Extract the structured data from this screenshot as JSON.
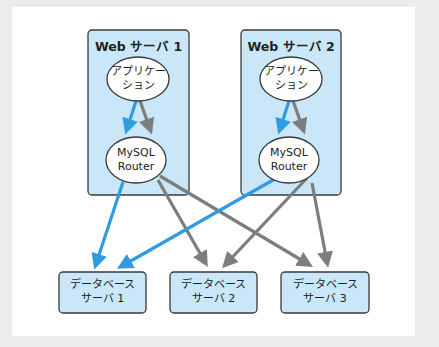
{
  "colors": {
    "background": "#ececec",
    "frame": "#ffffff",
    "box_fill": "#c9e7f8",
    "box_border": "#3a3a3a",
    "ellipse_fill": "#ffffff",
    "primary_arrow": "#2f9be0",
    "secondary_arrow": "#7d7d7d"
  },
  "web_servers": [
    {
      "title": "Web サーバ 1",
      "app": {
        "line1": "アプリケー",
        "line2": "ション"
      },
      "router": {
        "line1": "MySQL",
        "line2": "Router"
      }
    },
    {
      "title": "Web サーバ 2",
      "app": {
        "line1": "アプリケー",
        "line2": "ション"
      },
      "router": {
        "line1": "MySQL",
        "line2": "Router"
      }
    }
  ],
  "db_servers": [
    {
      "line1": "データベース",
      "line2": "サーバ 1"
    },
    {
      "line1": "データベース",
      "line2": "サーバ 2"
    },
    {
      "line1": "データベース",
      "line2": "サーバ 3"
    }
  ],
  "connections": [
    {
      "from": "Web サーバ 1 アプリケーション",
      "to": "Web サーバ 1 MySQL Router",
      "type": "primary"
    },
    {
      "from": "Web サーバ 1 アプリケーション",
      "to": "Web サーバ 1 MySQL Router",
      "type": "secondary"
    },
    {
      "from": "Web サーバ 2 アプリケーション",
      "to": "Web サーバ 2 MySQL Router",
      "type": "primary"
    },
    {
      "from": "Web サーバ 2 アプリケーション",
      "to": "Web サーバ 2 MySQL Router",
      "type": "secondary"
    },
    {
      "from": "Web サーバ 1 MySQL Router",
      "to": "データベース サーバ 1",
      "type": "primary"
    },
    {
      "from": "Web サーバ 1 MySQL Router",
      "to": "データベース サーバ 2",
      "type": "secondary"
    },
    {
      "from": "Web サーバ 1 MySQL Router",
      "to": "データベース サーバ 3",
      "type": "secondary"
    },
    {
      "from": "Web サーバ 2 MySQL Router",
      "to": "データベース サーバ 1",
      "type": "primary"
    },
    {
      "from": "Web サーバ 2 MySQL Router",
      "to": "データベース サーバ 2",
      "type": "secondary"
    },
    {
      "from": "Web サーバ 2 MySQL Router",
      "to": "データベース サーバ 3",
      "type": "secondary"
    }
  ]
}
